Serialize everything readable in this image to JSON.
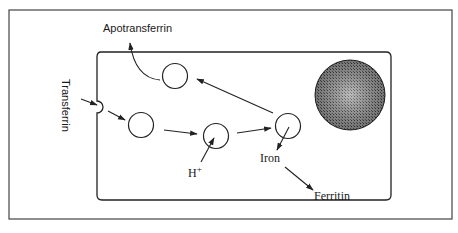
{
  "diagram": {
    "labels": {
      "apotransferrin": "Apotransferrin",
      "transferrin": "Transferrin",
      "proton": "H",
      "proton_sup": "+",
      "iron": "Iron",
      "ferritin": "Ferritin"
    },
    "nodes": [
      {
        "id": "coated-pit",
        "kind": "membrane-pit"
      },
      {
        "id": "endosome-early",
        "kind": "vesicle"
      },
      {
        "id": "endosome-acidified",
        "kind": "vesicle"
      },
      {
        "id": "endosome-iron-release",
        "kind": "vesicle"
      },
      {
        "id": "recycling-vesicle",
        "kind": "vesicle"
      },
      {
        "id": "nucleus",
        "kind": "nucleus"
      }
    ],
    "edges": [
      {
        "from": "Transferrin",
        "to": "coated-pit"
      },
      {
        "from": "coated-pit",
        "to": "endosome-early"
      },
      {
        "from": "endosome-early",
        "to": "endosome-acidified"
      },
      {
        "from": "H+",
        "to": "endosome-acidified"
      },
      {
        "from": "endosome-acidified",
        "to": "endosome-iron-release"
      },
      {
        "from": "endosome-iron-release",
        "to": "Iron"
      },
      {
        "from": "Iron",
        "to": "Ferritin"
      },
      {
        "from": "endosome-iron-release",
        "to": "recycling-vesicle"
      },
      {
        "from": "recycling-vesicle",
        "to": "Apotransferrin"
      }
    ],
    "colors": {
      "line": "#222222",
      "nucleus_fill": "#8a8a8a",
      "frame": "#444444"
    }
  }
}
